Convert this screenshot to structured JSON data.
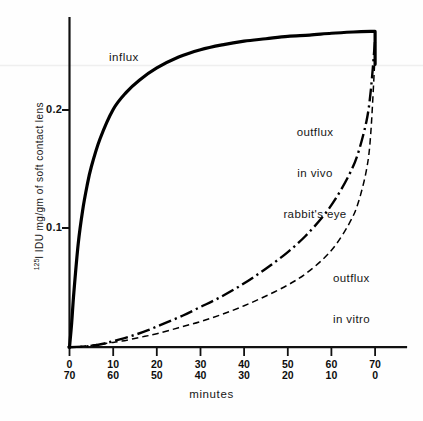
{
  "chart_data": {
    "type": "line",
    "title": "",
    "xlabel": "minutes",
    "ylabel": "125I IDU  mg/gm of soft contact lens",
    "ylabel_superscript": "125",
    "ylabel_rest": "I IDU  mg/gm of soft contact lens",
    "xlim": [
      0,
      70
    ],
    "ylim": [
      0,
      0.27
    ],
    "grid": false,
    "legend_position": "inline-annotations",
    "y_ticks": [
      {
        "value": 0.1,
        "label": "0.1"
      },
      {
        "value": 0.2,
        "label": "0.2"
      }
    ],
    "x_ticks": [
      {
        "value": 0,
        "label_top": "0",
        "label_bottom": "70"
      },
      {
        "value": 10,
        "label_top": "10",
        "label_bottom": "60"
      },
      {
        "value": 20,
        "label_top": "20",
        "label_bottom": "50"
      },
      {
        "value": 30,
        "label_top": "30",
        "label_bottom": "40"
      },
      {
        "value": 40,
        "label_top": "40",
        "label_bottom": "30"
      },
      {
        "value": 50,
        "label_top": "50",
        "label_bottom": "20"
      },
      {
        "value": 60,
        "label_top": "60",
        "label_bottom": "10"
      },
      {
        "value": 70,
        "label_top": "70",
        "label_bottom": "0"
      }
    ],
    "annotations": [
      {
        "name": "influx",
        "text": "influx"
      },
      {
        "name": "outflux-in-vivo",
        "text": "outflux\nin vivo\nrabbit's eye"
      },
      {
        "name": "outflux-in-vitro",
        "text": "outflux\nin vitro"
      }
    ],
    "series": [
      {
        "name": "influx",
        "label": "influx",
        "style": "solid",
        "width": 3.2,
        "color": "#000000",
        "x": [
          0,
          0.5,
          1,
          2,
          3,
          4,
          5,
          7,
          10,
          13,
          16,
          20,
          25,
          30,
          35,
          40,
          45,
          50,
          55,
          60,
          65,
          69,
          70,
          70
        ],
        "y": [
          0.0,
          0.02,
          0.045,
          0.085,
          0.112,
          0.132,
          0.148,
          0.171,
          0.195,
          0.209,
          0.219,
          0.229,
          0.238,
          0.244,
          0.248,
          0.251,
          0.253,
          0.255,
          0.256,
          0.2575,
          0.2585,
          0.259,
          0.259,
          0.232
        ]
      },
      {
        "name": "outflux-in-vivo-rabbits-eye",
        "label": "outflux in vivo rabbit's eye",
        "style": "dash-dot",
        "width": 2.4,
        "color": "#000000",
        "x": [
          0,
          3,
          5,
          8,
          10,
          14,
          18,
          22,
          26,
          30,
          34,
          38,
          42,
          46,
          50,
          54,
          58,
          61,
          64,
          66,
          68,
          69,
          70
        ],
        "y": [
          0.0,
          0.0005,
          0.001,
          0.003,
          0.005,
          0.009,
          0.014,
          0.02,
          0.026,
          0.033,
          0.04,
          0.048,
          0.057,
          0.067,
          0.078,
          0.091,
          0.107,
          0.122,
          0.141,
          0.158,
          0.185,
          0.21,
          0.252
        ]
      },
      {
        "name": "outflux-in-vitro",
        "label": "outflux in vitro",
        "style": "dashed",
        "width": 1.5,
        "color": "#000000",
        "x": [
          0,
          3,
          6,
          9,
          12,
          16,
          20,
          25,
          30,
          35,
          40,
          45,
          50,
          54,
          58,
          61,
          64,
          66,
          68,
          69,
          70
        ],
        "y": [
          0.0,
          0.0008,
          0.002,
          0.0035,
          0.005,
          0.008,
          0.011,
          0.016,
          0.021,
          0.027,
          0.034,
          0.042,
          0.051,
          0.06,
          0.072,
          0.084,
          0.101,
          0.117,
          0.145,
          0.175,
          0.24
        ]
      }
    ]
  },
  "axis": {
    "y_tick_0_1": "0.1",
    "y_tick_0_2": "0.2"
  },
  "xticks": {
    "t0": {
      "top": "0",
      "bottom": "70"
    },
    "t1": {
      "top": "10",
      "bottom": "60"
    },
    "t2": {
      "top": "20",
      "bottom": "50"
    },
    "t3": {
      "top": "30",
      "bottom": "40"
    },
    "t4": {
      "top": "40",
      "bottom": "30"
    },
    "t5": {
      "top": "50",
      "bottom": "20"
    },
    "t6": {
      "top": "60",
      "bottom": "10"
    },
    "t7": {
      "top": "70",
      "bottom": "0"
    }
  },
  "labels": {
    "influx": "influx",
    "invivo_line1": "outflux",
    "invivo_line2": "in vivo",
    "invivo_line3": "rabbit's eye",
    "invitro_line1": "outflux",
    "invitro_line2": "in vitro",
    "xaxis": "minutes",
    "yaxis_sup": "125",
    "yaxis_main": "I IDU  mg/gm of soft contact lens"
  },
  "colors": {
    "ink": "#000000",
    "background": "#fefefe",
    "artifact_line": "#efefef"
  }
}
